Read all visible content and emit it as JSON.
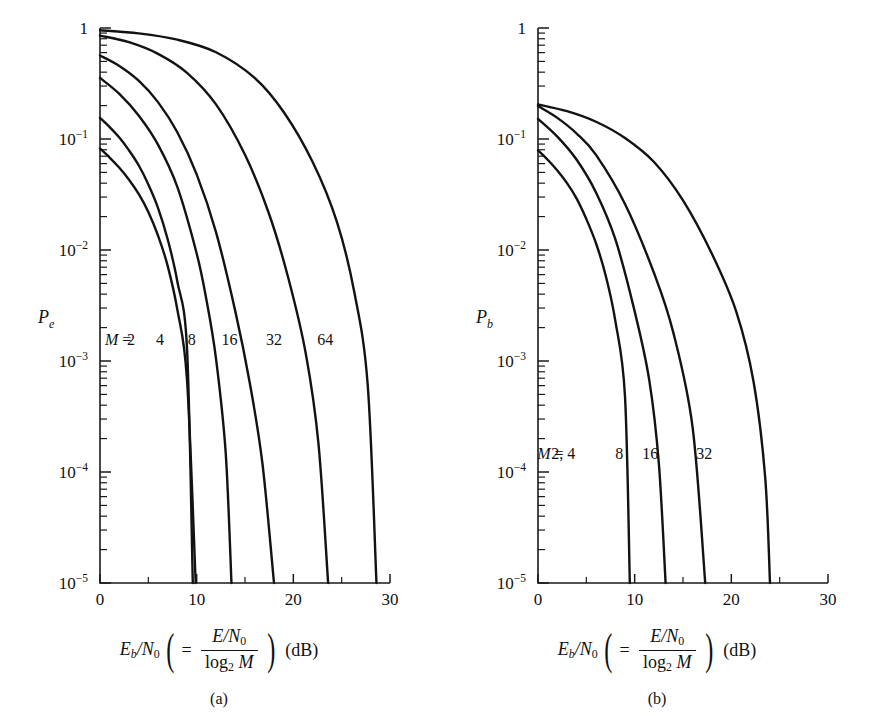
{
  "figure": {
    "panels": [
      {
        "id": "a",
        "letter": "(a)",
        "ylabel": "P",
        "ylabel_sub": "e",
        "xcaption": {
          "lead_var": "E",
          "lead_sub": "b",
          "lead_slash": "/N",
          "lead_sub2": "0",
          "eq": "=",
          "numerator_var": "E",
          "numerator_rest": "/N",
          "numerator_sub": "0",
          "denominator_log": "log",
          "denominator_base": "2",
          "denominator_var": "M",
          "units": "(dB)"
        },
        "curve_label_prefix": "M =",
        "curve_labels": [
          "2",
          "4",
          "8",
          "16",
          "32",
          "64"
        ],
        "curve_label_x": [
          3.2,
          6.2,
          9.5,
          13.4,
          18.0,
          23.3
        ],
        "curve_label_y": 0.0014
      },
      {
        "id": "b",
        "letter": "(b)",
        "ylabel": "P",
        "ylabel_sub": "b",
        "xcaption": {
          "lead_var": "E",
          "lead_sub": "b",
          "lead_slash": "/N",
          "lead_sub2": "0",
          "eq": "=",
          "numerator_var": "E",
          "numerator_rest": "/N",
          "numerator_sub": "0",
          "denominator_log": "log",
          "denominator_base": "2",
          "denominator_var": "M",
          "units": "(dB)"
        },
        "curve_label_prefix": "M =",
        "curve_labels": [
          "2, 4",
          "8",
          "16",
          "32"
        ],
        "curve_label_x": [
          2.6,
          8.4,
          11.6,
          17.2
        ],
        "curve_label_y": 0.00013
      }
    ]
  },
  "chart_data": [
    {
      "type": "line",
      "panel": "a",
      "title": "",
      "xlabel": "Eb/N0 ( = (E/N0) / log2 M ) (dB)",
      "ylabel": "Pe",
      "xlim": [
        0,
        30
      ],
      "ylim": [
        1e-05,
        1
      ],
      "yscale": "log",
      "xticks": [
        0,
        10,
        20,
        30
      ],
      "xticks_minor": [
        5,
        15,
        25
      ],
      "ytick_labels": [
        "1",
        "10-1",
        "10-2",
        "10-3",
        "10-4",
        "10-5"
      ],
      "yticks": [
        1,
        0.1,
        0.01,
        0.001,
        0.0001,
        1e-05
      ],
      "grid": false,
      "legend": "inline-curve-labels",
      "series": [
        {
          "name": "M = 2",
          "x": [
            0,
            1,
            2,
            3,
            4,
            5,
            6,
            7,
            8,
            9,
            9.6
          ],
          "y": [
            0.155,
            0.128,
            0.103,
            0.079,
            0.058,
            0.039,
            0.024,
            0.0125,
            0.0052,
            0.0013,
            1e-05
          ]
        },
        {
          "name": "M = 4",
          "x": [
            0,
            1,
            2,
            3,
            4,
            5,
            6,
            7,
            8,
            9,
            9.9
          ],
          "y": [
            0.082,
            0.068,
            0.055,
            0.043,
            0.032,
            0.022,
            0.0135,
            0.0072,
            0.0029,
            0.00068,
            1e-05
          ]
        },
        {
          "name": "M = 8",
          "x": [
            0,
            2,
            4,
            6,
            8,
            10,
            11,
            12,
            13,
            13.6
          ],
          "y": [
            0.355,
            0.255,
            0.163,
            0.089,
            0.037,
            0.0093,
            0.0036,
            0.00105,
            0.00015,
            1e-05
          ]
        },
        {
          "name": "M = 16",
          "x": [
            0,
            2,
            4,
            6,
            8,
            10,
            12,
            14,
            15.5,
            16.8,
            18.0
          ],
          "y": [
            0.565,
            0.455,
            0.335,
            0.215,
            0.115,
            0.048,
            0.0145,
            0.0028,
            0.00063,
            0.00012,
            1e-05
          ]
        },
        {
          "name": "M = 32",
          "x": [
            0,
            3,
            6,
            9,
            12,
            15,
            17.5,
            19.5,
            21.3,
            22.6,
            23.6
          ],
          "y": [
            0.855,
            0.745,
            0.585,
            0.395,
            0.205,
            0.072,
            0.021,
            0.0055,
            0.00115,
            0.00018,
            1e-05
          ]
        },
        {
          "name": "M = 64",
          "x": [
            0,
            4,
            8,
            12,
            16,
            19,
            22,
            24.5,
            26.3,
            27.7,
            28.6
          ],
          "y": [
            0.955,
            0.895,
            0.785,
            0.605,
            0.355,
            0.175,
            0.062,
            0.018,
            0.0042,
            0.0006,
            1e-05
          ]
        }
      ]
    },
    {
      "type": "line",
      "panel": "b",
      "title": "",
      "xlabel": "Eb/N0 ( = (E/N0) / log2 M ) (dB)",
      "ylabel": "Pb",
      "xlim": [
        0,
        30
      ],
      "ylim": [
        1e-05,
        1
      ],
      "yscale": "log",
      "xticks": [
        0,
        10,
        20,
        30
      ],
      "xticks_minor": [
        5,
        15,
        25
      ],
      "ytick_labels": [
        "1",
        "10-1",
        "10-2",
        "10-3",
        "10-4",
        "10-5"
      ],
      "yticks": [
        1,
        0.1,
        0.01,
        0.001,
        0.0001,
        1e-05
      ],
      "grid": false,
      "legend": "inline-curve-labels",
      "series": [
        {
          "name": "M = 2, 4",
          "x": [
            0,
            1,
            2,
            3,
            4,
            5,
            6,
            7,
            8,
            9,
            9.5
          ],
          "y": [
            0.079,
            0.065,
            0.052,
            0.04,
            0.029,
            0.019,
            0.0115,
            0.0059,
            0.0023,
            0.00048,
            1e-05
          ]
        },
        {
          "name": "M = 8",
          "x": [
            0,
            2,
            4,
            6,
            8,
            10,
            11.5,
            12.5,
            13.2
          ],
          "y": [
            0.152,
            0.105,
            0.065,
            0.033,
            0.0125,
            0.0028,
            0.00068,
            0.00012,
            1e-05
          ]
        },
        {
          "name": "M = 16",
          "x": [
            0,
            2,
            4,
            6,
            9,
            12,
            14,
            16,
            17.3
          ],
          "y": [
            0.198,
            0.155,
            0.112,
            0.072,
            0.026,
            0.0062,
            0.0018,
            0.00025,
            1e-05
          ]
        },
        {
          "name": "M = 32",
          "x": [
            0,
            3,
            6,
            9,
            12,
            15,
            18,
            20.5,
            22.3,
            23.5,
            24.0
          ],
          "y": [
            0.205,
            0.178,
            0.143,
            0.102,
            0.062,
            0.028,
            0.0092,
            0.0028,
            0.00065,
            9e-05,
            1e-05
          ]
        }
      ]
    }
  ]
}
